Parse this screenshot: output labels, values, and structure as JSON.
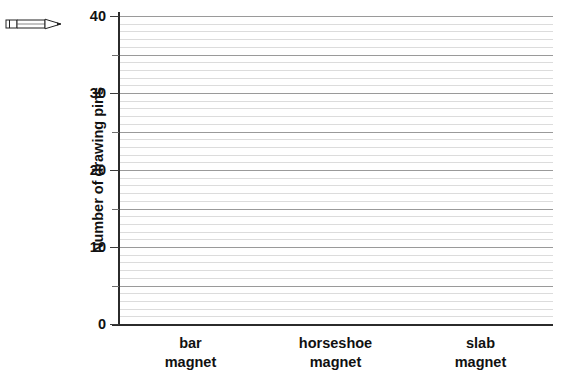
{
  "icons": {
    "pencil": "pencil-icon"
  },
  "chart_data": {
    "type": "bar",
    "title": "",
    "subtitle": "",
    "xlabel": "",
    "ylabel": "Number of drawing pins",
    "categories": [
      "bar magnet",
      "horseshoe magnet",
      "slab magnet"
    ],
    "category_lines": [
      [
        "bar",
        "magnet"
      ],
      [
        "horseshoe",
        "magnet"
      ],
      [
        "slab",
        "magnet"
      ]
    ],
    "values": [
      null,
      null,
      null
    ],
    "series": [
      {
        "name": "Number of drawing pins",
        "values": [
          null,
          null,
          null
        ]
      }
    ],
    "ylim": [
      0,
      40
    ],
    "ytick_labels": [
      "0",
      "10",
      "20",
      "30",
      "40"
    ],
    "ytick_values": [
      0,
      10,
      20,
      30,
      40
    ],
    "yminor_tick_values": [
      5,
      15,
      25,
      35
    ],
    "y_major_gridline_step": 5,
    "y_minor_gridline_step": 1,
    "grid": "horizontal",
    "legend": "none",
    "note": "empty grid template - no bars drawn",
    "colors": {
      "axis": "#2b2b2b",
      "major_gridline": "#9a9a9a",
      "minor_gridline": "#dcdcdc",
      "text": "#111111",
      "background": "#ffffff"
    }
  },
  "faint_header": ""
}
